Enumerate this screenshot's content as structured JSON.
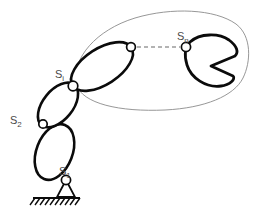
{
  "figure": {
    "type": "kinematic-chain-diagram",
    "background_color": "#ffffff",
    "link_stroke_color": "#0b0b0b",
    "joint_fill_color": "#ffffff",
    "workspace_outline_color": "#8b8b8b",
    "label_color": "#4a4a4a",
    "ellipsis_color": "#9a9a9a"
  },
  "labels": {
    "joint_1": {
      "base": "S",
      "subscript": "1"
    },
    "joint_2": {
      "base": "S",
      "subscript": "2"
    },
    "joint_i": {
      "base": "S",
      "subscript": "i"
    },
    "joint_n": {
      "base": "S",
      "subscript": "n"
    }
  },
  "joints": [
    {
      "name": "S1",
      "x": 66,
      "y": 180,
      "type": "grounded-pin"
    },
    {
      "name": "S2",
      "x": 43,
      "y": 124,
      "type": "revolute"
    },
    {
      "name": "Si",
      "x": 73,
      "y": 86,
      "type": "revolute"
    },
    {
      "name": "Sk",
      "x": 131,
      "y": 47,
      "type": "revolute"
    },
    {
      "name": "Sn",
      "x": 186,
      "y": 47,
      "type": "revolute"
    }
  ],
  "links": [
    {
      "name": "link-1",
      "from": "S1",
      "to": "S2",
      "shape": "ellipse"
    },
    {
      "name": "link-2",
      "from": "S2",
      "to": "Si",
      "shape": "ellipse"
    },
    {
      "name": "link-i",
      "from": "Si",
      "to": "Sk",
      "shape": "ellipse"
    },
    {
      "name": "link-n",
      "from": "Sn",
      "to": "end-effector",
      "shape": "crescent-gripper"
    }
  ],
  "ground": {
    "line_start_x": 33,
    "line_end_x": 80,
    "line_y": 198,
    "hatch_count": 9
  },
  "workspace": {
    "label": "reachable-workspace-envelope",
    "style": "thin-gray-blob-outline"
  },
  "ellipsis": {
    "label": "omitted-intermediate-links",
    "style": "gray-dashed-line"
  }
}
